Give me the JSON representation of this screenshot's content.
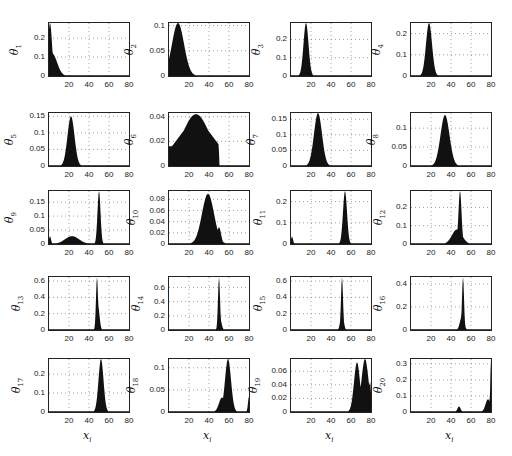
{
  "chart_data": {
    "type": "bar",
    "layout": {
      "rows": 5,
      "cols": 4,
      "grid": "dotted",
      "xlim": [
        0,
        80
      ],
      "xticks": [
        20,
        40,
        60,
        80
      ]
    },
    "xlabel": "x_i",
    "panels": [
      {
        "ylabel": "θ1",
        "ylim": [
          0,
          0.28
        ],
        "yticks": [
          "0",
          "0.1",
          "0.2"
        ],
        "peaks": [
          {
            "x": 1,
            "h": 0.28,
            "w": 2
          },
          {
            "x": 3,
            "h": 0.12,
            "w": 5
          }
        ],
        "note": "decaying from x=0"
      },
      {
        "ylabel": "θ2",
        "ylim": [
          0,
          0.105
        ],
        "yticks": [
          "0",
          "0.05",
          "0.1"
        ],
        "peaks": [
          {
            "x": 9,
            "h": 0.105,
            "w": 6
          }
        ]
      },
      {
        "ylabel": "θ3",
        "ylim": [
          0,
          0.29
        ],
        "yticks": [
          "0",
          "0.1",
          "0.2"
        ],
        "peaks": [
          {
            "x": 15,
            "h": 0.29,
            "w": 2.5
          }
        ]
      },
      {
        "ylabel": "θ4",
        "ylim": [
          0,
          0.25
        ],
        "yticks": [
          "0",
          "0.1",
          "0.2"
        ],
        "peaks": [
          {
            "x": 18,
            "h": 0.25,
            "w": 3
          }
        ]
      },
      {
        "ylabel": "θ5",
        "ylim": [
          0,
          0.16
        ],
        "yticks": [
          "0",
          "0.05",
          "0.1",
          "0.15"
        ],
        "peaks": [
          {
            "x": 22,
            "h": 0.15,
            "w": 3.5
          }
        ]
      },
      {
        "ylabel": "θ6",
        "ylim": [
          0,
          0.043
        ],
        "yticks": [
          "0",
          "0.02",
          "0.04"
        ],
        "peaks": [
          {
            "x": 27,
            "h": 0.042,
            "w": 14
          }
        ],
        "note": "broad 0-50"
      },
      {
        "ylabel": "θ7",
        "ylim": [
          0,
          0.17
        ],
        "yticks": [
          "0",
          "0.05",
          "0.1",
          "0.15"
        ],
        "peaks": [
          {
            "x": 27,
            "h": 0.17,
            "w": 4
          }
        ]
      },
      {
        "ylabel": "θ8",
        "ylim": [
          0,
          0.14
        ],
        "yticks": [
          "0",
          "0.05",
          "0.1"
        ],
        "peaks": [
          {
            "x": 34,
            "h": 0.135,
            "w": 4.5
          }
        ]
      },
      {
        "ylabel": "θ9",
        "ylim": [
          0,
          0.19
        ],
        "yticks": [
          "0",
          "0.05",
          "0.1",
          "0.15"
        ],
        "peaks": [
          {
            "x": 50,
            "h": 0.19,
            "w": 1.5
          },
          {
            "x": 23,
            "h": 0.028,
            "w": 7
          },
          {
            "x": 1,
            "h": 0.028,
            "w": 1
          }
        ]
      },
      {
        "ylabel": "θ10",
        "ylim": [
          0,
          0.095
        ],
        "yticks": [
          "0",
          "0.02",
          "0.04",
          "0.06",
          "0.08"
        ],
        "peaks": [
          {
            "x": 39,
            "h": 0.09,
            "w": 6
          },
          {
            "x": 50,
            "h": 0.03,
            "w": 2
          }
        ]
      },
      {
        "ylabel": "θ11",
        "ylim": [
          0,
          0.25
        ],
        "yticks": [
          "0",
          "0.1",
          "0.2"
        ],
        "peaks": [
          {
            "x": 54,
            "h": 0.25,
            "w": 2
          },
          {
            "x": 1,
            "h": 0.035,
            "w": 1
          }
        ]
      },
      {
        "ylabel": "θ12",
        "ylim": [
          0,
          0.29
        ],
        "yticks": [
          "0",
          "0.1",
          "0.2"
        ],
        "peaks": [
          {
            "x": 49,
            "h": 0.29,
            "w": 1.5
          },
          {
            "x": 46,
            "h": 0.08,
            "w": 5
          }
        ]
      },
      {
        "ylabel": "θ13",
        "ylim": [
          0,
          0.65
        ],
        "yticks": [
          "0",
          "0.2",
          "0.4",
          "0.6"
        ],
        "peaks": [
          {
            "x": 48,
            "h": 0.65,
            "w": 1
          },
          {
            "x": 49,
            "h": 0.3,
            "w": 1.5
          }
        ]
      },
      {
        "ylabel": "θ14",
        "ylim": [
          0,
          0.75
        ],
        "yticks": [
          "0",
          "0.2",
          "0.4",
          "0.6"
        ],
        "peaks": [
          {
            "x": 50,
            "h": 0.75,
            "w": 1
          },
          {
            "x": 51,
            "h": 0.17,
            "w": 1.5
          }
        ]
      },
      {
        "ylabel": "θ15",
        "ylim": [
          0,
          0.65
        ],
        "yticks": [
          "0",
          "0.2",
          "0.4",
          "0.6"
        ],
        "peaks": [
          {
            "x": 51,
            "h": 0.65,
            "w": 1
          },
          {
            "x": 51,
            "h": 0.24,
            "w": 1.5
          }
        ]
      },
      {
        "ylabel": "θ16",
        "ylim": [
          0,
          0.46
        ],
        "yticks": [
          "0",
          "0.2",
          "0.4"
        ],
        "peaks": [
          {
            "x": 52,
            "h": 0.46,
            "w": 1
          },
          {
            "x": 51,
            "h": 0.12,
            "w": 2
          }
        ]
      },
      {
        "ylabel": "θ17",
        "ylim": [
          0,
          0.28
        ],
        "yticks": [
          "0",
          "0.1",
          "0.2"
        ],
        "peaks": [
          {
            "x": 52,
            "h": 0.28,
            "w": 2.5
          }
        ]
      },
      {
        "ylabel": "θ18",
        "ylim": [
          0,
          0.12
        ],
        "yticks": [
          "0",
          "0.05",
          "0.1"
        ],
        "peaks": [
          {
            "x": 59,
            "h": 0.12,
            "w": 3
          },
          {
            "x": 53,
            "h": 0.033,
            "w": 3
          },
          {
            "x": 80,
            "h": 0.035,
            "w": 1
          }
        ]
      },
      {
        "ylabel": "θ19",
        "ylim": [
          0,
          0.078
        ],
        "yticks": [
          "0",
          "0.02",
          "0.04",
          "0.06"
        ],
        "peaks": [
          {
            "x": 66,
            "h": 0.073,
            "w": 3
          },
          {
            "x": 74,
            "h": 0.078,
            "w": 3.5
          },
          {
            "x": 79,
            "h": 0.045,
            "w": 1
          }
        ]
      },
      {
        "ylabel": "θ20",
        "ylim": [
          0,
          0.33
        ],
        "yticks": [
          "0",
          "0.1",
          "0.2",
          "0.3"
        ],
        "peaks": [
          {
            "x": 80,
            "h": 0.33,
            "w": 0.7
          },
          {
            "x": 77,
            "h": 0.08,
            "w": 2.5
          },
          {
            "x": 48,
            "h": 0.035,
            "w": 1.5
          }
        ]
      }
    ]
  },
  "labels": {
    "xlabel_main": "x",
    "xlabel_sub": "i",
    "ylabel_main": "θ",
    "xticks": [
      "20",
      "40",
      "60",
      "80"
    ],
    "panel_subs": [
      "1",
      "2",
      "3",
      "4",
      "5",
      "6",
      "7",
      "8",
      "9",
      "10",
      "11",
      "12",
      "13",
      "14",
      "15",
      "16",
      "17",
      "18",
      "19",
      "20"
    ]
  }
}
